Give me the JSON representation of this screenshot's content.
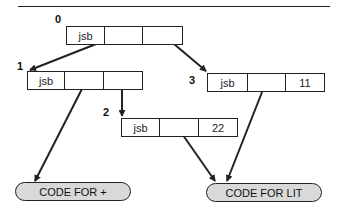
{
  "diagram": {
    "nodes": [
      {
        "id": "0",
        "label": "0",
        "cells": [
          "jsb",
          "",
          ""
        ]
      },
      {
        "id": "1",
        "label": "1",
        "cells": [
          "jsb",
          "",
          ""
        ]
      },
      {
        "id": "2",
        "label": "2",
        "cells": [
          "jsb",
          "",
          "22"
        ]
      },
      {
        "id": "3",
        "label": "3",
        "cells": [
          "jsb",
          "",
          "11"
        ]
      }
    ],
    "targets": [
      {
        "id": "plus",
        "label": "CODE FOR +"
      },
      {
        "id": "lit",
        "label": "CODE FOR LIT"
      }
    ],
    "edges": [
      {
        "from": "0.cell2",
        "to": "1"
      },
      {
        "from": "0.cell3",
        "to": "3"
      },
      {
        "from": "1.cell3",
        "to": "2"
      },
      {
        "from": "1.cell2",
        "to": "plus"
      },
      {
        "from": "2.cell2",
        "to": "lit"
      },
      {
        "from": "3.cell2",
        "to": "lit"
      }
    ],
    "colors": {
      "stroke": "#222222",
      "pill_fill": "#d9d9d9"
    }
  }
}
